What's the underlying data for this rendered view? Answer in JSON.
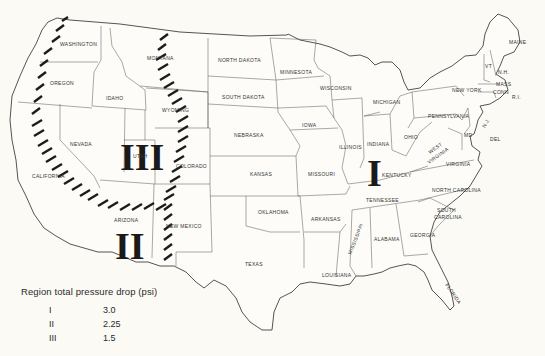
{
  "map": {
    "type": "choropleth-region-map",
    "subject": "United States (contiguous) regions by total pressure drop",
    "regions": [
      {
        "numeral": "I",
        "label": "Region I",
        "position": "east-central (Kentucky/Indiana area)"
      },
      {
        "numeral": "II",
        "label": "Region II",
        "position": "southwest (Arizona)"
      },
      {
        "numeral": "III",
        "label": "Region III",
        "position": "mountain west (Utah)"
      }
    ],
    "state_labels": {
      "washington": "WASHINGTON",
      "oregon": "OREGON",
      "california": "CALIFORNIA",
      "nevada": "NEVADA",
      "idaho": "IDAHO",
      "montana": "MONTANA",
      "wyoming": "WYOMING",
      "utah": "UTAH",
      "colorado": "COLORADO",
      "arizona": "ARIZONA",
      "new_mexico": "NEW MEXICO",
      "north_dakota": "NORTH DAKOTA",
      "south_dakota": "SOUTH DAKOTA",
      "nebraska": "NEBRASKA",
      "kansas": "KANSAS",
      "oklahoma": "OKLAHOMA",
      "texas": "TEXAS",
      "minnesota": "MINNESOTA",
      "iowa": "IOWA",
      "missouri": "MISSOURI",
      "arkansas": "ARKANSAS",
      "louisiana": "LOUISIANA",
      "wisconsin": "WISCONSIN",
      "illinois": "ILLINOIS",
      "michigan": "MICHIGAN",
      "indiana": "INDIANA",
      "ohio": "OHIO",
      "kentucky": "KENTUCKY",
      "tennessee": "TENNESSEE",
      "mississippi": "MISSISSIPPI",
      "alabama": "ALABAMA",
      "georgia": "GEORGIA",
      "florida": "FLORIDA",
      "south_carolina_1": "SOUTH",
      "south_carolina_2": "CAROLINA",
      "north_carolina": "NORTH CAROLINA",
      "virginia": "VIRGINIA",
      "west_virginia_1": "WEST",
      "west_virginia_2": "VIRGINIA",
      "pennsylvania": "PENNSYLVANIA",
      "new_york": "NEW YORK",
      "maryland": "MD",
      "delaware": "DEL",
      "new_jersey": "N.J.",
      "vermont": "VT",
      "new_hampshire": "N.H.",
      "maine": "MAINE",
      "massachusetts": "MASS",
      "connecticut": "CONN",
      "rhode_island": "R.I."
    }
  },
  "legend": {
    "title": "Region total pressure drop (psi)",
    "rows": [
      {
        "region": "I",
        "value": "3.0"
      },
      {
        "region": "II",
        "value": "2.25"
      },
      {
        "region": "III",
        "value": "1.5"
      }
    ]
  }
}
